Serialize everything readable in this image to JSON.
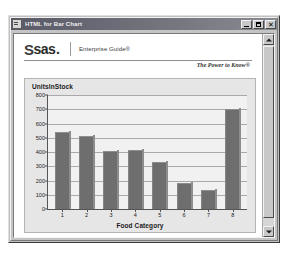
{
  "window": {
    "title": "HTML for Bar Chart",
    "icon": "document-icon",
    "minimize_label": "",
    "maximize_label": "",
    "close_label": "✕"
  },
  "brand": {
    "logo_s": "S",
    "logo_word": "sas",
    "logo_dot": ".",
    "product": "Enterprise Guide®",
    "tagline": "The Power to Know®"
  },
  "scrollbar": {
    "up_arrow": "scroll-up-arrow",
    "down_arrow": "scroll-down-arrow"
  },
  "chart_data": {
    "type": "bar",
    "title": "UnitsInStock",
    "xlabel": "Food Category",
    "ylabel": "",
    "categories": [
      "1",
      "2",
      "3",
      "4",
      "5",
      "6",
      "7",
      "8"
    ],
    "values": [
      540,
      510,
      410,
      415,
      330,
      180,
      130,
      700
    ],
    "yticks": [
      0,
      100,
      200,
      300,
      400,
      500,
      600,
      700,
      800
    ],
    "ylim": [
      0,
      800
    ],
    "grid": true,
    "legend": false,
    "bar_color": "#6e6e6e",
    "plot_background": "#f1f1f1",
    "panel_background": "#e6e6e6"
  }
}
